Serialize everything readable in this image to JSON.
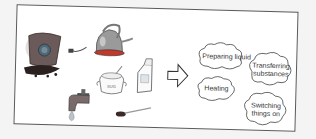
{
  "diagram": {
    "left_items": [
      {
        "name": "coffee-bag",
        "label": ""
      },
      {
        "name": "electric-kettle",
        "label": ""
      },
      {
        "name": "water-faucet",
        "label": ""
      },
      {
        "name": "sugar-bowl",
        "label": "SUGAR"
      },
      {
        "name": "milk-carton",
        "label": ""
      },
      {
        "name": "spoon",
        "label": ""
      }
    ],
    "arrow": {
      "direction": "right"
    },
    "clouds": [
      {
        "label": "Preparing liquid"
      },
      {
        "label_line1": "Transferring",
        "label_line2": "substances"
      },
      {
        "label": "Heating"
      },
      {
        "label_line1": "Switching",
        "label_line2": "things on"
      }
    ],
    "colors": {
      "frame_border": "#5a5a5a",
      "kettle": "#9a9a9a",
      "kettle_base": "#c0392b",
      "coffee_bag": "#6a5a5a",
      "coffee_beans": "#2a2020",
      "faucet": "#7a6a6a",
      "water_drop": "#b8c4cc"
    }
  }
}
